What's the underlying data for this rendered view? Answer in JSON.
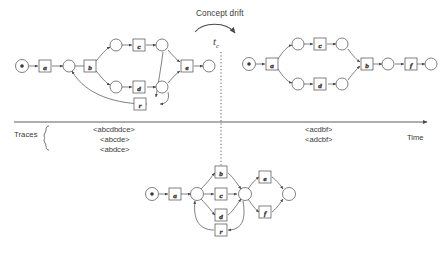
{
  "figure": {
    "title": "Concept drift",
    "drift_marker": {
      "label": "t",
      "subscript": "c"
    },
    "axis": {
      "left_label": "Traces",
      "right_label": "Time"
    },
    "ink_color": "#4a4a4a",
    "text_color": "#3a3a3a",
    "bg_color": "#ffffff"
  },
  "traces": {
    "before": [
      "<abcdbdce>",
      "<abcde>",
      "<abdce>"
    ],
    "after": [
      "<acdbf>",
      "<adcbf>"
    ]
  },
  "nets": {
    "before": {
      "name": "process-model-before-drift",
      "transitions": [
        "a",
        "b",
        "c",
        "d",
        "e",
        "r"
      ],
      "places": 8,
      "start_marking": 1
    },
    "after": {
      "name": "process-model-after-drift",
      "transitions": [
        "a",
        "c",
        "d",
        "b",
        "f"
      ],
      "places": 7,
      "start_marking": 1
    },
    "merged": {
      "name": "process-model-merged",
      "transitions": [
        "a",
        "b",
        "c",
        "d",
        "r",
        "e",
        "f"
      ],
      "places": 4,
      "start_marking": 1
    }
  }
}
